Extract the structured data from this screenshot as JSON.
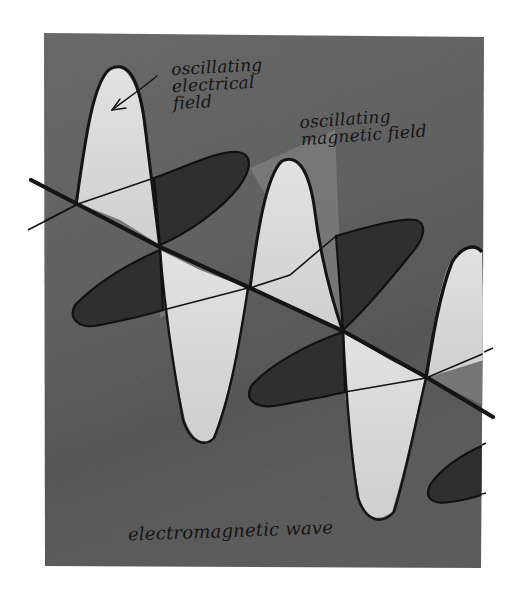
{
  "diagram": {
    "title": "electromagnetic wave",
    "style": "hand-drawn watercolor, grayscale",
    "colors": {
      "background": "#ffffff",
      "panel": "#6e6e6e",
      "panel_dark": "#585858",
      "electric_lobe": "#d9d9d9",
      "magnetic_lobe": "#303030",
      "ink": "#141414"
    },
    "labels": {
      "electric_field": {
        "line1": "oscillating",
        "line2": "electrical",
        "line3": "field"
      },
      "magnetic_field": {
        "line1": "oscillating",
        "line2": "magnetic field"
      },
      "wave": "electromagnetic wave"
    },
    "elements": [
      {
        "name": "propagation-axis",
        "description": "thick diagonal line from upper-left to lower-right"
      },
      {
        "name": "electric-field-lobes",
        "description": "light vertical elongated lobes alternating up/down along axis"
      },
      {
        "name": "magnetic-field-lobes",
        "description": "dark horizontal elongated lobes alternating along axis, perpendicular to electric lobes"
      },
      {
        "name": "arrow",
        "description": "arrow pointing from 'oscillating electrical field' label to first electric lobe"
      }
    ]
  }
}
